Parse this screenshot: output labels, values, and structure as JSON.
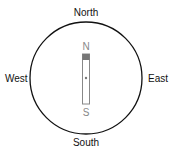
{
  "compass": {
    "north": "North",
    "south": "South",
    "east": "East",
    "west": "West"
  },
  "needle": {
    "north_pole": "N",
    "south_pole": "S",
    "north_color": "#777777",
    "outline_color": "#888888"
  }
}
